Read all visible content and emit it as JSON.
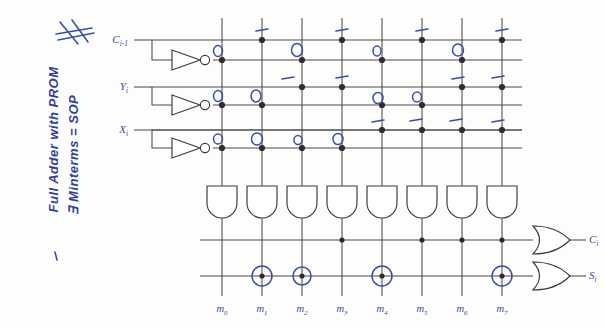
{
  "figure": {
    "title": "Full Adder with PROM",
    "handwritten_notes": [
      "Full Adder with PROM",
      "∃ Minterms ⇒ SOP"
    ],
    "note_line_1": "Full Adder with PROM",
    "note_line_2": "∃ Minterms = SOP",
    "scribble_mark": "#",
    "ink_color": "#3a4ea8",
    "wire_color": "#4a4a4a"
  },
  "inputs": [
    {
      "name": "input-c",
      "label": "C",
      "sub": "i-1",
      "true_row": 1,
      "comp_row": 2
    },
    {
      "name": "input-y",
      "label": "Y",
      "sub": "i",
      "true_row": 3,
      "comp_row": 4
    },
    {
      "name": "input-x",
      "label": "X",
      "sub": "i",
      "true_row": 5,
      "comp_row": 6
    }
  ],
  "outputs": [
    {
      "name": "output-carry",
      "label": "C",
      "sub": "i",
      "gate": "OR"
    },
    {
      "name": "output-sum",
      "label": "S",
      "sub": "i",
      "gate": "OR"
    }
  ],
  "minterms": [
    {
      "label": "m",
      "sub": "0",
      "column": 1
    },
    {
      "label": "m",
      "sub": "1",
      "column": 2
    },
    {
      "label": "m",
      "sub": "2",
      "column": 3
    },
    {
      "label": "m",
      "sub": "3",
      "column": 4
    },
    {
      "label": "m",
      "sub": "4",
      "column": 5
    },
    {
      "label": "m",
      "sub": "5",
      "column": 6
    },
    {
      "label": "m",
      "sub": "6",
      "column": 7
    },
    {
      "label": "m",
      "sub": "7",
      "column": 8
    }
  ],
  "and_gates": {
    "count": 8,
    "type": "AND"
  },
  "inverters": {
    "count": 3,
    "type": "NOT"
  },
  "and_plane_connections": [
    {
      "row": 1,
      "columns": [
        2,
        4,
        6,
        8
      ]
    },
    {
      "row": 2,
      "columns": [
        1,
        3,
        5,
        7
      ]
    },
    {
      "row": 3,
      "columns": [
        3,
        4,
        7,
        8
      ]
    },
    {
      "row": 4,
      "columns": [
        1,
        2,
        5,
        6
      ]
    },
    {
      "row": 5,
      "columns": [
        5,
        6,
        7,
        8
      ]
    },
    {
      "row": 6,
      "columns": [
        1,
        2,
        3,
        4
      ]
    }
  ],
  "or_plane_connections": [
    {
      "output": "C_i",
      "row": 7,
      "columns": [
        4,
        6,
        7,
        8
      ]
    },
    {
      "output": "S_i",
      "row": 8,
      "columns": [
        2,
        3,
        5,
        8
      ],
      "circled": [
        2,
        3,
        5,
        8
      ]
    }
  ],
  "blue_annotations": {
    "circles": [
      {
        "row": 2,
        "columns": [
          1,
          3,
          5,
          7
        ]
      },
      {
        "row": 4,
        "columns": [
          1,
          2,
          5,
          6
        ]
      },
      {
        "row": 6,
        "columns": [
          1,
          2,
          3,
          4
        ]
      }
    ],
    "dashes": [
      {
        "row": 1,
        "columns": [
          2,
          4,
          6,
          8
        ]
      },
      {
        "row": 3,
        "columns": [
          3,
          4,
          7,
          8
        ]
      },
      {
        "row": 5,
        "columns": [
          5,
          6,
          7,
          8
        ]
      }
    ]
  }
}
